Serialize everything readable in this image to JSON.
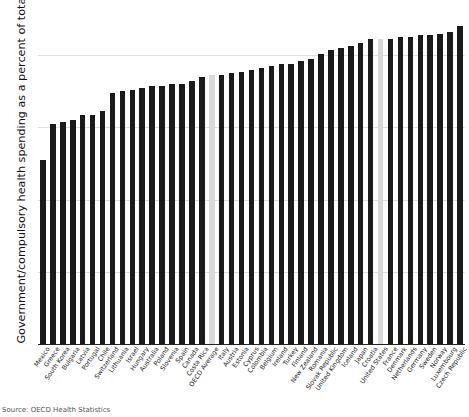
{
  "chart_data": {
    "type": "bar",
    "title": "",
    "xlabel": "",
    "ylabel": "Government/compulsory health spending as a percent of total",
    "ylim": [
      0,
      92
    ],
    "yticks": [
      0,
      20,
      40,
      60,
      80
    ],
    "ytick_labels": [
      "0",
      "20",
      "40",
      "60",
      "80"
    ],
    "grid": true,
    "legend_position": "none",
    "bar_color": "#1a1a1a",
    "highlight_color": "#d9d9d9",
    "highlighted_categories": [
      "OECD Average",
      "United States"
    ],
    "categories": [
      "Mexico",
      "Greece",
      "South Korea",
      "Bulgaria",
      "Latvia",
      "Portugal",
      "Chile",
      "Switzerland",
      "Lithuania",
      "Israel",
      "Hungary",
      "Australia",
      "Poland",
      "Slovenia",
      "Spain",
      "Canada",
      "Costa Rica",
      "OECD Average",
      "Italy",
      "Austria",
      "Estonia",
      "Cyprus",
      "Colombia",
      "Belgium",
      "Ireland",
      "Turkey",
      "Finland",
      "New Zealand",
      "Romania",
      "Slovak Republic",
      "United Kingdom",
      "Iceland",
      "Japan",
      "Croatia",
      "United States",
      "France",
      "Denmark",
      "Netherlands",
      "Germany",
      "Sweden",
      "Norway",
      "Luxembourg",
      "Czech Republic"
    ],
    "values": [
      51.0,
      61.0,
      61.5,
      62.0,
      63.5,
      63.5,
      64.5,
      69.5,
      70.0,
      70.5,
      71.0,
      71.5,
      71.5,
      72.0,
      72.0,
      73.0,
      74.0,
      74.5,
      74.5,
      75.0,
      75.5,
      76.0,
      76.5,
      77.0,
      77.5,
      77.5,
      78.5,
      79.0,
      80.5,
      81.5,
      82.0,
      82.5,
      83.5,
      84.5,
      84.5,
      84.5,
      85.0,
      85.0,
      85.5,
      85.5,
      86.0,
      86.5,
      88.0
    ]
  },
  "caption": {
    "text": "Source: OECD Health Statistics"
  }
}
